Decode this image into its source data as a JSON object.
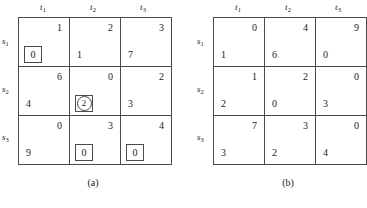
{
  "figure": {
    "tables": [
      {
        "id": "a",
        "caption": "(a)",
        "column_headers": [
          {
            "base": "t",
            "sub": "1"
          },
          {
            "base": "t",
            "sub": "2"
          },
          {
            "base": "t",
            "sub": "3"
          }
        ],
        "row_headers": [
          {
            "base": "s",
            "sub": "1"
          },
          {
            "base": "s",
            "sub": "2"
          },
          {
            "base": "s",
            "sub": "3"
          }
        ],
        "rows": [
          [
            {
              "cost": "1",
              "alloc": "0",
              "boxed": true,
              "circled": false
            },
            {
              "cost": "2",
              "alloc": "1",
              "boxed": false,
              "circled": false
            },
            {
              "cost": "3",
              "alloc": "7",
              "boxed": false,
              "circled": false
            }
          ],
          [
            {
              "cost": "6",
              "alloc": "4",
              "boxed": false,
              "circled": false
            },
            {
              "cost": "0",
              "alloc": "2",
              "boxed": true,
              "circled": true
            },
            {
              "cost": "2",
              "alloc": "3",
              "boxed": false,
              "circled": false
            }
          ],
          [
            {
              "cost": "0",
              "alloc": "9",
              "boxed": false,
              "circled": false
            },
            {
              "cost": "3",
              "alloc": "0",
              "boxed": true,
              "circled": false
            },
            {
              "cost": "4",
              "alloc": "0",
              "boxed": true,
              "circled": false
            }
          ]
        ]
      },
      {
        "id": "b",
        "caption": "(b)",
        "column_headers": [
          {
            "base": "t",
            "sub": "1"
          },
          {
            "base": "t",
            "sub": "2"
          },
          {
            "base": "t",
            "sub": "3"
          }
        ],
        "row_headers": [
          {
            "base": "s",
            "sub": "1"
          },
          {
            "base": "s",
            "sub": "2"
          },
          {
            "base": "s",
            "sub": "3"
          }
        ],
        "rows": [
          [
            {
              "cost": "0",
              "alloc": "1",
              "boxed": false,
              "circled": false
            },
            {
              "cost": "4",
              "alloc": "6",
              "boxed": false,
              "circled": false
            },
            {
              "cost": "9",
              "alloc": "0",
              "boxed": false,
              "circled": false
            }
          ],
          [
            {
              "cost": "1",
              "alloc": "2",
              "boxed": false,
              "circled": false
            },
            {
              "cost": "2",
              "alloc": "0",
              "boxed": false,
              "circled": false
            },
            {
              "cost": "0",
              "alloc": "3",
              "boxed": false,
              "circled": false
            }
          ],
          [
            {
              "cost": "7",
              "alloc": "3",
              "boxed": false,
              "circled": false
            },
            {
              "cost": "3",
              "alloc": "2",
              "boxed": false,
              "circled": false
            },
            {
              "cost": "0",
              "alloc": "4",
              "boxed": false,
              "circled": false
            }
          ]
        ]
      }
    ],
    "bottom_artifact": "",
    "colors": {
      "rule": "#4a4a4a",
      "text": "#1a1a1a",
      "background": "#ffffff"
    }
  }
}
